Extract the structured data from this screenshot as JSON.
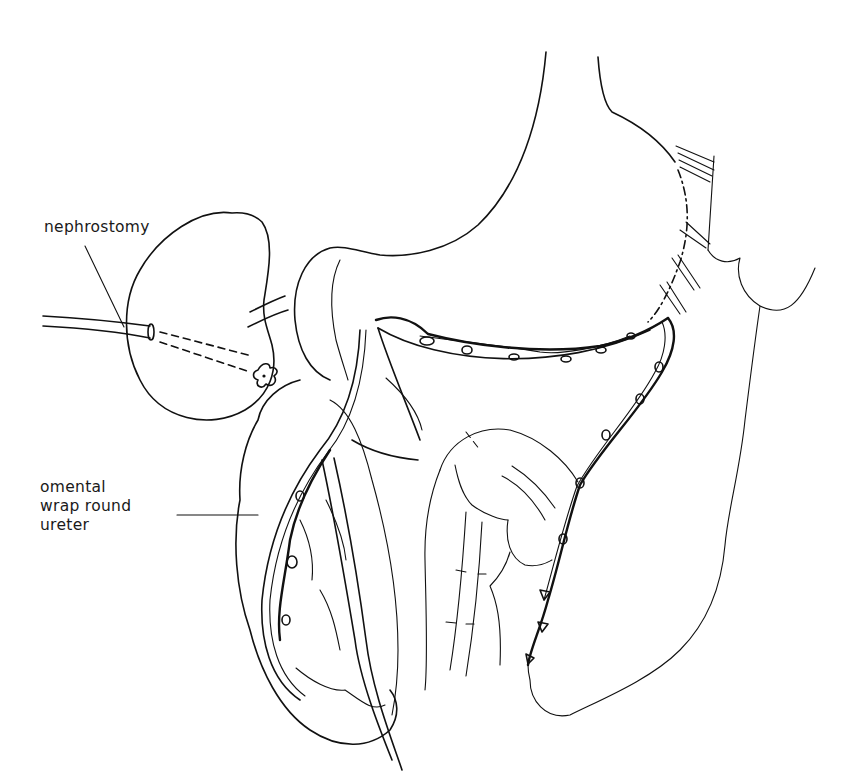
{
  "figure": {
    "type": "surgical line illustration",
    "colors": {
      "ink": "#111111",
      "background": "#ffffff"
    }
  },
  "labels": {
    "nephrostomy": "nephrostomy",
    "omental_wrap": {
      "line1": "omental",
      "line2": "wrap round",
      "line3": "ureter"
    }
  },
  "structures": [
    {
      "name": "kidney",
      "icon": "kidney-outline"
    },
    {
      "name": "nephrostomy-tube",
      "icon": "tube"
    },
    {
      "name": "stomach",
      "icon": "stomach-outline"
    },
    {
      "name": "omentum",
      "icon": "omentum-outline"
    },
    {
      "name": "ureter",
      "icon": "ureter"
    },
    {
      "name": "bowel",
      "icon": "bowel-loops"
    },
    {
      "name": "suture-line",
      "icon": "sutures"
    }
  ]
}
